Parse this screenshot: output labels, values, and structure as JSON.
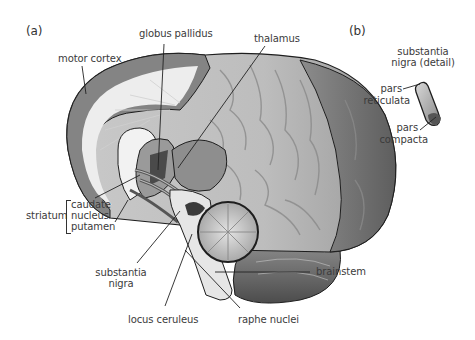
{
  "figure": {
    "panels": [
      {
        "id": "a",
        "label": "(a)"
      },
      {
        "id": "b",
        "label": "(b)"
      }
    ],
    "panel_a": {
      "subject": "sagittal view of human brain",
      "labels": {
        "motor_cortex": "motor cortex",
        "globus_pallidus": "globus pallidus",
        "thalamus": "thalamus",
        "striatum": "striatum",
        "caudate_nucleus_line1": "caudate",
        "caudate_nucleus_line2": "nucleus",
        "putamen": "putamen",
        "substantia_nigra_line1": "substantia",
        "substantia_nigra_line2": "nigra",
        "locus_ceruleus": "locus ceruleus",
        "raphe_nuclei": "raphe nuclei",
        "brainstem": "brainstem"
      }
    },
    "panel_b": {
      "subject": "substantia nigra detail",
      "labels": {
        "title_line1": "substantia",
        "title_line2": "nigra (detail)",
        "pars_reticulata_line1": "pars",
        "pars_reticulata_line2": "reticulata",
        "pars_compacta_line1": "pars",
        "pars_compacta_line2": "compacta"
      }
    },
    "colors": {
      "background": "#ffffff",
      "text": "#3b3b3b",
      "cortex_dark": "#7a7a7a",
      "cortex_mid": "#a8a8a8",
      "cortex_light": "#d2d2d2",
      "white_matter": "#ececec",
      "outline": "#1e1e1e"
    }
  }
}
